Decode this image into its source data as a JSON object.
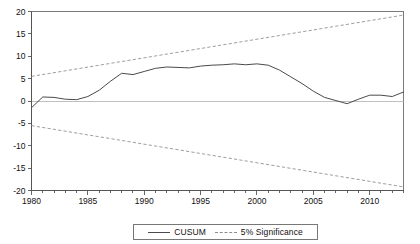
{
  "chart_data": {
    "type": "line",
    "title": "",
    "xlabel": "",
    "ylabel": "",
    "xlim": [
      1980,
      2013
    ],
    "ylim": [
      -20,
      20
    ],
    "grid": false,
    "zero_reference_line": 0,
    "legend_position": "bottom-center",
    "y_ticks": [
      20,
      15,
      10,
      5,
      0,
      -5,
      -10,
      -15,
      -20
    ],
    "y_tick_labels": [
      "20",
      "15",
      "10",
      "5",
      "0",
      "-5",
      "-10",
      "-15",
      "-20"
    ],
    "x_ticks": [
      1980,
      1985,
      1990,
      1995,
      2000,
      2005,
      2010
    ],
    "x_tick_labels": [
      "1980",
      "1985",
      "1990",
      "1995",
      "2000",
      "2005",
      "2010"
    ],
    "x_minor_tick_interval": 1,
    "series": [
      {
        "name": "CUSUM",
        "style": "solid",
        "color": "#4a4a4a",
        "x": [
          1980,
          1981,
          1982,
          1983,
          1984,
          1985,
          1986,
          1987,
          1988,
          1989,
          1990,
          1991,
          1992,
          1993,
          1994,
          1995,
          1996,
          1997,
          1998,
          1999,
          2000,
          2001,
          2002,
          2003,
          2004,
          2005,
          2006,
          2007,
          2008,
          2009,
          2010,
          2011,
          2012,
          2013
        ],
        "values": [
          -1.5,
          0.9,
          0.8,
          0.4,
          0.3,
          1.0,
          2.4,
          4.4,
          6.2,
          5.9,
          6.6,
          7.3,
          7.6,
          7.5,
          7.4,
          7.8,
          8.0,
          8.1,
          8.3,
          8.1,
          8.3,
          8.0,
          6.9,
          5.4,
          3.9,
          2.2,
          0.8,
          0.1,
          -0.6,
          0.4,
          1.3,
          1.3,
          1.0,
          2.0
        ]
      },
      {
        "name": "5% Significance",
        "style": "dashed",
        "color": "#8c8c8c",
        "x": [
          1980,
          2013
        ],
        "values": [
          5.5,
          19.2
        ]
      },
      {
        "name": "5% Significance",
        "style": "dashed",
        "color": "#8c8c8c",
        "x": [
          1980,
          2013
        ],
        "values": [
          -5.5,
          -19.2
        ]
      }
    ],
    "legend": [
      {
        "label": "CUSUM",
        "style": "solid"
      },
      {
        "label": "5% Significance",
        "style": "dashed"
      }
    ]
  }
}
